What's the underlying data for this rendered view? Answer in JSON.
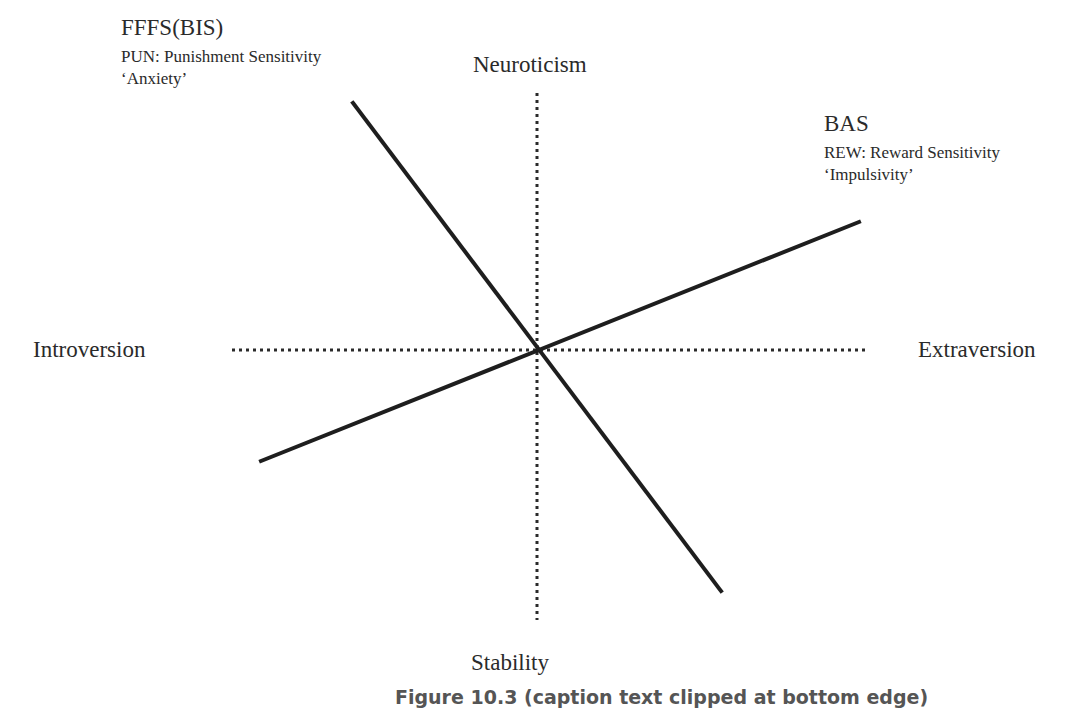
{
  "diagram": {
    "axes": {
      "top": "Neuroticism",
      "bottom": "Stability",
      "left": "Introversion",
      "right": "Extraversion"
    },
    "bis": {
      "title": "FFFS(BIS)",
      "line1": "PUN: Punishment Sensitivity",
      "line2": "‘Anxiety’"
    },
    "bas": {
      "title": "BAS",
      "line1": "REW: Reward Sensitivity",
      "line2": "‘Impulsivity’"
    },
    "caption": "Figure 10.3  (caption text clipped at bottom edge)",
    "colors": {
      "line": "#1e1e1e",
      "dotted": "#2a2a2a",
      "text": "#2a2a2a"
    }
  }
}
